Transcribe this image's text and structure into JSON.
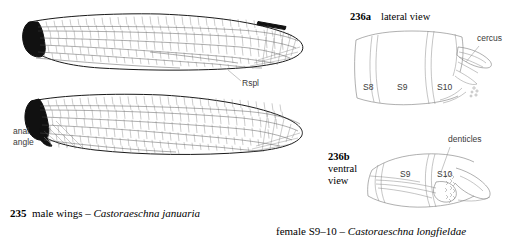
{
  "figure": {
    "background_color": "#ffffff",
    "ink_color": "#1a1a1a",
    "label_color": "#3a3a3a"
  },
  "left_panel": {
    "caption": {
      "number": "235",
      "text": "male wings – ",
      "species": "Castoraeschna januaria"
    },
    "annotations": [
      {
        "id": "rspl",
        "text": "Rspl"
      },
      {
        "id": "anal-angle-line1",
        "text": "anal"
      },
      {
        "id": "anal-angle-line2",
        "text": "angle"
      }
    ],
    "wings": [
      {
        "id": "forewing",
        "name": "forewing"
      },
      {
        "id": "hindwing",
        "name": "hindwing"
      }
    ]
  },
  "right_panel": {
    "lateral": {
      "number": "236a",
      "view_label": "lateral view",
      "segments": [
        "S8",
        "S9",
        "S10"
      ],
      "annotations": [
        "cercus"
      ]
    },
    "ventral": {
      "number": "236b",
      "view_label_line1": "ventral",
      "view_label_line2": "view",
      "segments": [
        "S9",
        "S10"
      ],
      "annotations": [
        "denticles"
      ]
    },
    "caption": {
      "text": "female S9–10 – ",
      "species": "Castoraeschna longfieldae"
    }
  }
}
